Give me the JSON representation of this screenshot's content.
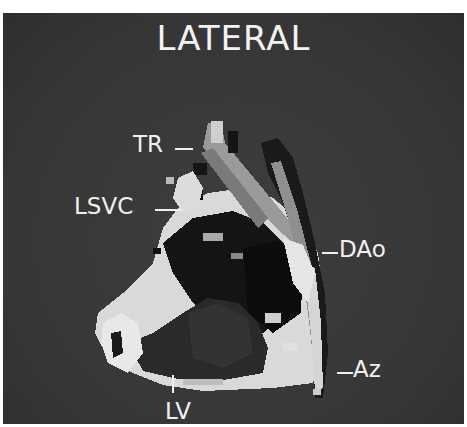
{
  "figure": {
    "title": "LATERAL",
    "background_color": "#3a3a3a",
    "text_color": "#f0f0f0",
    "labels": [
      {
        "id": "tr",
        "text": "TR"
      },
      {
        "id": "lsvc",
        "text": "LSVC"
      },
      {
        "id": "dao",
        "text": "DAo"
      },
      {
        "id": "az",
        "text": "Az"
      },
      {
        "id": "lv",
        "text": "LV"
      }
    ]
  }
}
